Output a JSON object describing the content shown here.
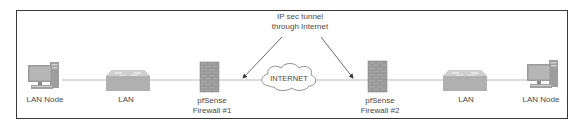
{
  "diagram": {
    "tunnel_label": {
      "line1": "IP sec tunnel",
      "line2": "through Internet"
    },
    "cloud_label": "INTERNET",
    "nodes": [
      {
        "id": "lan-node-left",
        "type": "computer",
        "label": "LAN Node"
      },
      {
        "id": "lan-left",
        "type": "switch",
        "label": "LAN"
      },
      {
        "id": "firewall-1",
        "type": "firewall",
        "label_line1": "pfSense",
        "label_line2": "Firewall #1"
      },
      {
        "id": "internet",
        "type": "cloud",
        "label": "INTERNET"
      },
      {
        "id": "firewall-2",
        "type": "firewall",
        "label_line1": "pfSense",
        "label_line2": "Firewall #2"
      },
      {
        "id": "lan-right",
        "type": "switch",
        "label": "LAN"
      },
      {
        "id": "lan-node-right",
        "type": "computer",
        "label": "LAN Node"
      }
    ],
    "colors": {
      "frame": "#3a3a3a",
      "line": "#9a9a9a",
      "arrow": "#333333",
      "icon_fill": "#b4b4b4",
      "icon_dark": "#8a8a8a",
      "text": "#4a4a4a"
    }
  }
}
